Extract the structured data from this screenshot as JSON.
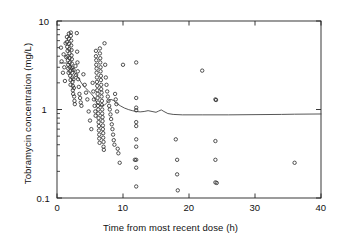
{
  "chart_data": {
    "type": "scatter",
    "title": "",
    "subtitle": "",
    "xlabel": "Time from most recent dose (h)",
    "ylabel": "Tobramycin concentration (mg/L)",
    "xlim": [
      0,
      40
    ],
    "ylim": [
      0.1,
      10
    ],
    "yscale": "log",
    "xscale": "linear",
    "grid": false,
    "legend": null,
    "xticks": [
      0,
      10,
      20,
      30,
      40
    ],
    "xtick_labels": [
      "0",
      "10",
      "20",
      "30",
      "40"
    ],
    "yticks": [
      0.1,
      1,
      10
    ],
    "ytick_labels": [
      "0.1",
      "1",
      "10"
    ],
    "y_minor_ticks": [
      0.2,
      0.3,
      0.4,
      0.5,
      0.6,
      0.7,
      0.8,
      0.9,
      2,
      3,
      4,
      5,
      6,
      7,
      8,
      9
    ],
    "marker": "open-circle",
    "marker_color": "#333333",
    "marker_size_px": 3.4,
    "line_color": "#444444",
    "line_width_px": 0.9,
    "frame_color": "#222222",
    "background": "#ffffff",
    "series": [
      {
        "name": "observed concentrations",
        "type": "scatter",
        "points": [
          [
            0.6,
            5.0
          ],
          [
            0.7,
            3.5
          ],
          [
            0.9,
            2.6
          ],
          [
            1.0,
            4.2
          ],
          [
            1.1,
            3.0
          ],
          [
            1.2,
            2.1
          ],
          [
            1.3,
            5.6
          ],
          [
            1.4,
            3.9
          ],
          [
            1.5,
            6.6
          ],
          [
            1.5,
            5.8
          ],
          [
            1.55,
            5.1
          ],
          [
            1.6,
            4.6
          ],
          [
            1.6,
            4.0
          ],
          [
            1.65,
            3.6
          ],
          [
            1.7,
            3.2
          ],
          [
            1.7,
            2.9
          ],
          [
            1.75,
            2.6
          ],
          [
            1.8,
            7.2
          ],
          [
            1.8,
            6.3
          ],
          [
            1.85,
            5.5
          ],
          [
            1.85,
            4.8
          ],
          [
            1.9,
            4.3
          ],
          [
            1.9,
            3.8
          ],
          [
            1.95,
            3.4
          ],
          [
            1.95,
            3.0
          ],
          [
            2.0,
            2.7
          ],
          [
            2.0,
            2.4
          ],
          [
            2.05,
            2.15
          ],
          [
            2.05,
            1.9
          ],
          [
            2.1,
            7.4
          ],
          [
            2.1,
            6.8
          ],
          [
            2.15,
            6.0
          ],
          [
            2.15,
            5.3
          ],
          [
            2.2,
            4.7
          ],
          [
            2.2,
            4.1
          ],
          [
            2.25,
            3.7
          ],
          [
            2.25,
            3.3
          ],
          [
            2.3,
            2.95
          ],
          [
            2.3,
            2.6
          ],
          [
            2.35,
            2.3
          ],
          [
            2.35,
            2.05
          ],
          [
            2.4,
            1.85
          ],
          [
            2.4,
            1.65
          ],
          [
            2.45,
            1.5
          ],
          [
            2.5,
            2.8
          ],
          [
            2.5,
            2.2
          ],
          [
            2.55,
            1.75
          ],
          [
            2.6,
            1.4
          ],
          [
            2.65,
            1.25
          ],
          [
            2.7,
            1.15
          ],
          [
            2.8,
            3.1
          ],
          [
            2.9,
            2.45
          ],
          [
            3.0,
            7.3
          ],
          [
            3.05,
            4.5
          ],
          [
            3.1,
            3.4
          ],
          [
            3.15,
            2.7
          ],
          [
            3.2,
            2.2
          ],
          [
            3.3,
            1.8
          ],
          [
            3.4,
            1.5
          ],
          [
            3.5,
            1.35
          ],
          [
            3.6,
            1.2
          ],
          [
            3.7,
            1.1
          ],
          [
            4.0,
            2.5
          ],
          [
            4.2,
            1.9
          ],
          [
            4.4,
            1.55
          ],
          [
            4.6,
            1.3
          ],
          [
            4.8,
            0.95
          ],
          [
            5.0,
            0.75
          ],
          [
            5.2,
            0.6
          ],
          [
            5.4,
            2.0
          ],
          [
            5.5,
            1.6
          ],
          [
            5.6,
            1.3
          ],
          [
            5.7,
            1.1
          ],
          [
            5.8,
            0.95
          ],
          [
            5.85,
            0.85
          ],
          [
            5.9,
            4.6
          ],
          [
            5.9,
            4.0
          ],
          [
            5.95,
            3.6
          ],
          [
            5.95,
            3.2
          ],
          [
            6.0,
            2.9
          ],
          [
            6.0,
            2.6
          ],
          [
            6.05,
            2.3
          ],
          [
            6.05,
            2.05
          ],
          [
            6.1,
            1.85
          ],
          [
            6.1,
            1.65
          ],
          [
            6.15,
            1.5
          ],
          [
            6.15,
            1.35
          ],
          [
            6.2,
            1.2
          ],
          [
            6.2,
            1.1
          ],
          [
            6.25,
            1.0
          ],
          [
            6.25,
            0.9
          ],
          [
            6.3,
            0.8
          ],
          [
            6.3,
            0.72
          ],
          [
            6.35,
            0.65
          ],
          [
            6.35,
            0.58
          ],
          [
            6.4,
            0.52
          ],
          [
            6.4,
            0.47
          ],
          [
            6.45,
            0.42
          ],
          [
            6.5,
            4.9
          ],
          [
            6.5,
            4.3
          ],
          [
            6.55,
            3.8
          ],
          [
            6.55,
            3.4
          ],
          [
            6.6,
            3.0
          ],
          [
            6.6,
            2.7
          ],
          [
            6.65,
            2.4
          ],
          [
            6.65,
            2.15
          ],
          [
            6.7,
            1.9
          ],
          [
            6.7,
            1.7
          ],
          [
            6.75,
            1.55
          ],
          [
            6.75,
            1.4
          ],
          [
            6.8,
            1.25
          ],
          [
            6.8,
            1.12
          ],
          [
            6.85,
            1.0
          ],
          [
            6.85,
            0.9
          ],
          [
            6.9,
            0.82
          ],
          [
            6.9,
            0.74
          ],
          [
            6.95,
            0.66
          ],
          [
            6.95,
            0.6
          ],
          [
            7.0,
            0.54
          ],
          [
            7.0,
            0.48
          ],
          [
            7.05,
            0.43
          ],
          [
            7.05,
            0.38
          ],
          [
            7.1,
            0.35
          ],
          [
            7.2,
            5.6
          ],
          [
            7.3,
            3.2
          ],
          [
            7.4,
            2.3
          ],
          [
            7.5,
            1.9
          ],
          [
            7.6,
            1.6
          ],
          [
            7.7,
            1.4
          ],
          [
            7.8,
            1.25
          ],
          [
            7.9,
            1.1
          ],
          [
            8.0,
            1.0
          ],
          [
            8.1,
            0.88
          ],
          [
            8.2,
            0.78
          ],
          [
            8.3,
            0.68
          ],
          [
            8.4,
            0.6
          ],
          [
            8.5,
            0.52
          ],
          [
            8.6,
            0.45
          ],
          [
            8.7,
            0.4
          ],
          [
            8.8,
            1.5
          ],
          [
            8.9,
            1.3
          ],
          [
            9.0,
            1.15
          ],
          [
            9.1,
            0.95
          ],
          [
            9.2,
            0.36
          ],
          [
            9.3,
            0.32
          ],
          [
            9.5,
            0.25
          ],
          [
            10.0,
            3.2
          ],
          [
            11.8,
            0.27
          ],
          [
            12.0,
            3.4
          ],
          [
            12.0,
            1.35
          ],
          [
            12.0,
            1.05
          ],
          [
            12.0,
            0.98
          ],
          [
            12.0,
            0.72
          ],
          [
            12.0,
            0.65
          ],
          [
            12.0,
            0.46
          ],
          [
            12.0,
            0.38
          ],
          [
            12.0,
            0.27
          ],
          [
            12.0,
            0.22
          ],
          [
            12.0,
            0.135
          ],
          [
            18.0,
            0.46
          ],
          [
            18.2,
            0.27
          ],
          [
            18.2,
            0.185
          ],
          [
            18.3,
            0.122
          ],
          [
            22.0,
            2.75
          ],
          [
            24.0,
            1.3
          ],
          [
            24.1,
            1.28
          ],
          [
            24.0,
            0.44
          ],
          [
            24.0,
            0.27
          ],
          [
            24.0,
            0.15
          ],
          [
            24.2,
            0.148
          ],
          [
            36.0,
            0.25
          ]
        ]
      },
      {
        "name": "median predicted concentration",
        "type": "line",
        "points": [
          [
            0.4,
            3.35
          ],
          [
            1.6,
            3.35
          ],
          [
            2.0,
            3.2
          ],
          [
            2.4,
            2.85
          ],
          [
            2.8,
            2.55
          ],
          [
            3.2,
            2.3
          ],
          [
            3.6,
            2.05
          ],
          [
            4.0,
            1.85
          ],
          [
            4.4,
            1.72
          ],
          [
            4.8,
            1.62
          ],
          [
            5.2,
            1.5
          ],
          [
            5.6,
            1.38
          ],
          [
            6.0,
            1.2
          ],
          [
            6.4,
            1.12
          ],
          [
            6.8,
            1.1
          ],
          [
            7.2,
            1.12
          ],
          [
            7.6,
            1.2
          ],
          [
            7.9,
            1.28
          ],
          [
            8.2,
            1.3
          ],
          [
            8.6,
            1.26
          ],
          [
            9.0,
            1.18
          ],
          [
            9.6,
            1.1
          ],
          [
            10.2,
            1.04
          ],
          [
            10.8,
            1.0
          ],
          [
            11.4,
            0.97
          ],
          [
            12.0,
            0.95
          ],
          [
            12.6,
            0.94
          ],
          [
            13.2,
            0.95
          ],
          [
            13.8,
            0.97
          ],
          [
            14.4,
            0.95
          ],
          [
            15.0,
            0.93
          ],
          [
            15.4,
            0.96
          ],
          [
            15.8,
            0.99
          ],
          [
            16.2,
            0.95
          ],
          [
            16.8,
            0.9
          ],
          [
            17.6,
            0.88
          ],
          [
            19.0,
            0.87
          ],
          [
            22.0,
            0.87
          ],
          [
            26.0,
            0.87
          ],
          [
            30.0,
            0.875
          ],
          [
            34.0,
            0.88
          ],
          [
            36.0,
            0.885
          ],
          [
            40.0,
            0.89
          ]
        ]
      }
    ]
  },
  "figure": {
    "x_axis_title": "Time from most recent dose (h)",
    "y_axis_title": "Tobramycin concentration (mg/L)",
    "x_tick_0": "0",
    "x_tick_1": "10",
    "x_tick_2": "20",
    "x_tick_3": "30",
    "x_tick_4": "40",
    "y_tick_0": "0.1",
    "y_tick_1": "1",
    "y_tick_2": "10"
  }
}
